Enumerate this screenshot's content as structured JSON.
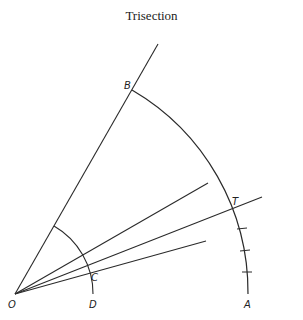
{
  "title": "Trisection",
  "diagram": {
    "colors": {
      "stroke": "#2a2a2a",
      "baseline": "#7a8a5a",
      "baseline_tint": "#9a7aa0",
      "background": "#ffffff"
    },
    "points": {
      "O": {
        "label": "O",
        "x": 15,
        "y": 294
      },
      "A": {
        "label": "A",
        "x": 248,
        "y": 294
      },
      "B": {
        "label": "B",
        "x": 132,
        "y": 90
      },
      "C": {
        "label": "C",
        "x": 88,
        "y": 272
      },
      "D": {
        "label": "D",
        "x": 93,
        "y": 294
      },
      "T": {
        "label": "T",
        "x": 235,
        "y": 209
      }
    },
    "labels": {
      "O": "O",
      "A": "A",
      "B": "B",
      "C": "C",
      "D": "D",
      "T": "T"
    },
    "tick_marks_between_T_and_A": 3
  }
}
